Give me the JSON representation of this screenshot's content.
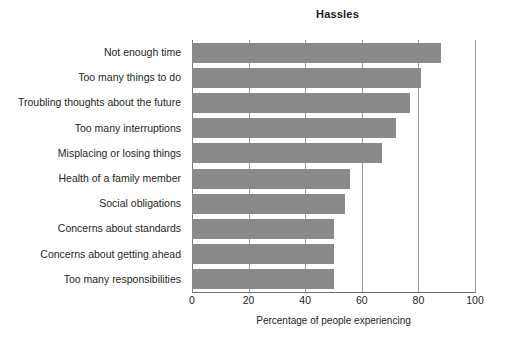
{
  "chart_data": {
    "type": "bar",
    "orientation": "horizontal",
    "title": "Hassles",
    "xlabel": "Percentage of people experiencing",
    "ylabel": "",
    "xlim": [
      0,
      100
    ],
    "xticks": [
      0,
      20,
      40,
      60,
      80,
      100
    ],
    "xtick_labels": [
      "0",
      "20",
      "40",
      "60",
      "80",
      "100"
    ],
    "grid": "vertical",
    "legend": "none",
    "bar_color": "#8a8a8a",
    "categories": [
      "Not enough time",
      "Too many things to do",
      "Troubling thoughts about the future",
      "Too many interruptions",
      "Misplacing or losing things",
      "Health of a family member",
      "Social obligations",
      "Concerns about standards",
      "Concerns about getting ahead",
      "Too many responsibilities"
    ],
    "values": [
      88,
      81,
      77,
      72,
      67,
      56,
      54,
      50,
      50,
      50
    ]
  }
}
